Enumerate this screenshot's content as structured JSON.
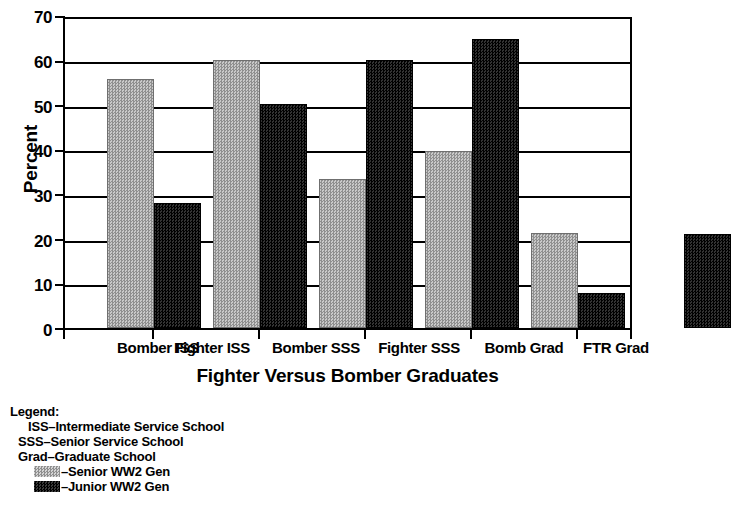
{
  "chart_data": {
    "type": "bar",
    "title": "",
    "xlabel": "Fighter Versus Bomber Graduates",
    "ylabel": "Percent",
    "ylim": [
      0,
      70
    ],
    "ytick_values": [
      0,
      10,
      20,
      30,
      40,
      50,
      60,
      70
    ],
    "ytick_labels": [
      "0",
      "10",
      "20",
      "30",
      "40",
      "50",
      "60",
      "70"
    ],
    "grid": true,
    "legend_position": "below-plot-left",
    "categories": [
      "Bomber ISS",
      "Fighter ISS",
      "Bomber SSS",
      "Fighter SSS",
      "Bomb Grad",
      "FTR Grad"
    ],
    "series": [
      {
        "name": "Senior WW2 Gen",
        "color": "#a8a8a8",
        "values": [
          55.7,
          60.0,
          33.3,
          39.6,
          21.3,
          null
        ]
      },
      {
        "name": "Junior WW2 Gen",
        "color": "#141414",
        "values": [
          28.0,
          50.0,
          60.0,
          64.7,
          7.8,
          21.1
        ]
      }
    ]
  },
  "legend": {
    "heading": "Legend:",
    "definitions": [
      "ISS–Intermediate Service School",
      "SSS–Senior Service School",
      "Grad–Graduate School"
    ],
    "series_entries": [
      {
        "swatch": "senior-swatch",
        "label": "–Senior WW2 Gen"
      },
      {
        "swatch": "junior-swatch",
        "label": "–Junior WW2 Gen"
      }
    ]
  }
}
